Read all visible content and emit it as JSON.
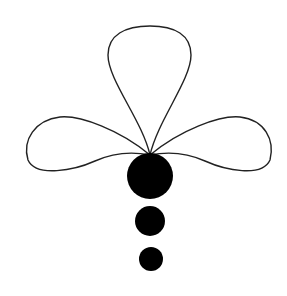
{
  "figure": {
    "background": "#ffffff",
    "stroke_color": "#222222",
    "fill_color": "#000000"
  }
}
